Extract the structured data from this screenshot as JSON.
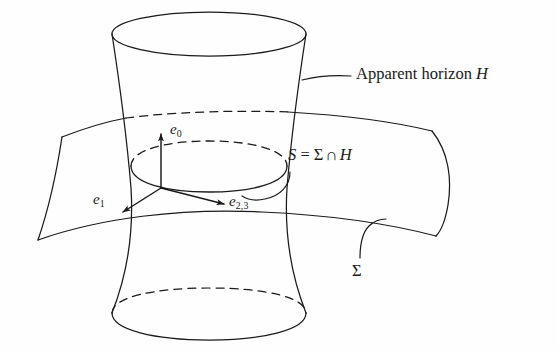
{
  "figure": {
    "background_color": "#fefefe",
    "ink_color": "#1a1a1a",
    "width": 557,
    "height": 351
  },
  "labels": {
    "apparent_horizon": {
      "text_plain": "Apparent horizon H",
      "prefix": "Apparent horizon ",
      "symbol": "H"
    },
    "intersection": {
      "text_plain": "S = Σ ∩ H",
      "lhs": "S",
      "equals": "=",
      "sigma": "Σ",
      "cap": "∩",
      "rhs": "H"
    },
    "slice": {
      "text_plain": "Σ",
      "symbol": "Σ"
    },
    "e0": {
      "text_plain": "e0",
      "base": "e",
      "subscript": "0"
    },
    "e1": {
      "text_plain": "e1",
      "base": "e",
      "subscript": "1"
    },
    "e23": {
      "text_plain": "e2,3",
      "base": "e",
      "subscript": "2,3"
    }
  },
  "elements": {
    "horizon_surface_name": "hyperboloid-apparent-horizon",
    "slice_surface_name": "spatial-slice-sigma",
    "intersection_circle_name": "intersection-circle-s",
    "tetrad_name": "orthonormal-tetrad"
  }
}
